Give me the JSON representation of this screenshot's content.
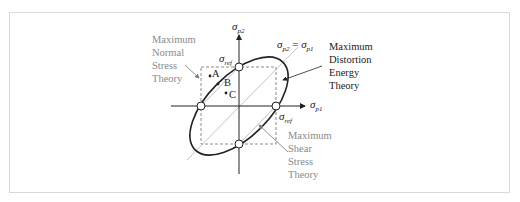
{
  "diagram": {
    "type": "failure-criteria-principal-stress-plane",
    "axes": {
      "x": {
        "symbol": "σ",
        "sub": "p1"
      },
      "y": {
        "symbol": "σ",
        "sub": "p2"
      }
    },
    "diagonal": {
      "lhs_symbol": "σ",
      "lhs_sub": "p2",
      "eq": " = ",
      "rhs_symbol": "σ",
      "rhs_sub": "p1"
    },
    "ref_labels": [
      {
        "symbol": "σ",
        "sub": "ref",
        "position": "top"
      },
      {
        "symbol": "σ",
        "sub": "ref",
        "position": "right"
      }
    ],
    "points": [
      {
        "label": "A"
      },
      {
        "label": "B"
      },
      {
        "label": "C"
      }
    ],
    "theories": {
      "normal": {
        "lines": [
          "Maximum",
          "Normal",
          "Stress",
          "Theory"
        ],
        "color": "#8a8a8a"
      },
      "distortion": {
        "lines": [
          "Maximum",
          "Distortion",
          "Energy",
          "Theory"
        ],
        "color": "#222222"
      },
      "shear": {
        "lines": [
          "Maximum",
          "Shear",
          "Stress",
          "Theory"
        ],
        "color": "#8a8a8a"
      }
    },
    "colors": {
      "ellipse": "#222222",
      "axes": "#222222",
      "dashed_square": "#8a8a8a",
      "diagonal_line": "#bdbdbd",
      "frame": "#d9d9d9"
    }
  }
}
